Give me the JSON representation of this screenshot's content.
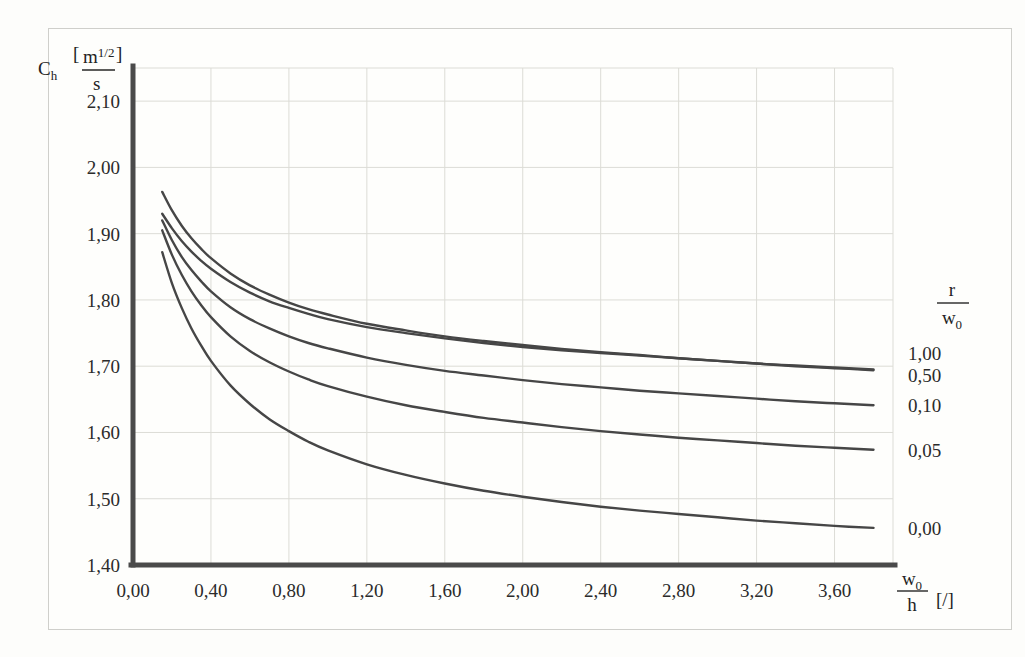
{
  "figure": {
    "yaxis_symbol": "C",
    "yaxis_subscript": "h",
    "yaxis_unit_numerator": "m",
    "yaxis_unit_numerator_exp": "1/2",
    "yaxis_unit_denominator": "s",
    "xaxis_numerator": "w",
    "xaxis_numerator_subscript": "0",
    "xaxis_denominator": "h",
    "xaxis_unit": "[/]",
    "legend_numerator": "r",
    "legend_denominator": "w",
    "legend_denominator_subscript": "0"
  },
  "chart_data": {
    "type": "line",
    "title": "",
    "xlabel": "w0/h [/]",
    "ylabel": "Ch [m^(1/2)/s]",
    "xlim": [
      0.0,
      3.9
    ],
    "ylim": [
      1.4,
      2.15
    ],
    "grid": true,
    "legend_position": "right",
    "legend_title": "r/w0",
    "x_tick_labels": [
      "0,00",
      "0,40",
      "0,80",
      "1,20",
      "1,60",
      "2,00",
      "2,40",
      "2,80",
      "3,20",
      "3,60"
    ],
    "x_tick_values": [
      0.0,
      0.4,
      0.8,
      1.2,
      1.6,
      2.0,
      2.4,
      2.8,
      3.2,
      3.6
    ],
    "y_tick_labels": [
      "1,40",
      "1,50",
      "1,60",
      "1,70",
      "1,80",
      "1,90",
      "2,00",
      "2,10"
    ],
    "y_tick_values": [
      1.4,
      1.5,
      1.6,
      1.7,
      1.8,
      1.9,
      2.0,
      2.1
    ],
    "series": [
      {
        "name": "1,00",
        "label": "1,00",
        "x": [
          0.15,
          0.2,
          0.25,
          0.3,
          0.35,
          0.4,
          0.5,
          0.6,
          0.7,
          0.8,
          0.9,
          1.0,
          1.2,
          1.4,
          1.6,
          1.8,
          2.0,
          2.2,
          2.4,
          2.6,
          2.8,
          3.0,
          3.2,
          3.4,
          3.6,
          3.8
        ],
        "y": [
          1.963,
          1.935,
          1.912,
          1.893,
          1.877,
          1.863,
          1.84,
          1.822,
          1.808,
          1.796,
          1.786,
          1.778,
          1.764,
          1.754,
          1.745,
          1.738,
          1.732,
          1.726,
          1.721,
          1.717,
          1.712,
          1.708,
          1.704,
          1.7,
          1.697,
          1.694
        ]
      },
      {
        "name": "0,50",
        "label": "0,50",
        "x": [
          0.15,
          0.2,
          0.25,
          0.3,
          0.35,
          0.4,
          0.5,
          0.6,
          0.7,
          0.8,
          0.9,
          1.0,
          1.2,
          1.4,
          1.6,
          1.8,
          2.0,
          2.2,
          2.4,
          2.6,
          2.8,
          3.0,
          3.2,
          3.4,
          3.6,
          3.8
        ],
        "y": [
          1.93,
          1.908,
          1.889,
          1.873,
          1.859,
          1.847,
          1.827,
          1.811,
          1.798,
          1.788,
          1.779,
          1.771,
          1.759,
          1.75,
          1.742,
          1.735,
          1.729,
          1.724,
          1.72,
          1.716,
          1.712,
          1.708,
          1.704,
          1.701,
          1.698,
          1.695
        ]
      },
      {
        "name": "0,10",
        "label": "0,10",
        "x": [
          0.15,
          0.2,
          0.25,
          0.3,
          0.35,
          0.4,
          0.5,
          0.6,
          0.7,
          0.8,
          0.9,
          1.0,
          1.2,
          1.4,
          1.6,
          1.8,
          2.0,
          2.2,
          2.4,
          2.6,
          2.8,
          3.0,
          3.2,
          3.4,
          3.6,
          3.8
        ],
        "y": [
          1.92,
          1.89,
          1.865,
          1.845,
          1.828,
          1.813,
          1.789,
          1.771,
          1.757,
          1.745,
          1.735,
          1.727,
          1.713,
          1.702,
          1.693,
          1.686,
          1.679,
          1.673,
          1.668,
          1.663,
          1.659,
          1.655,
          1.651,
          1.647,
          1.644,
          1.641
        ]
      },
      {
        "name": "0,05",
        "label": "0,05",
        "x": [
          0.15,
          0.2,
          0.25,
          0.3,
          0.35,
          0.4,
          0.5,
          0.6,
          0.7,
          0.8,
          0.9,
          1.0,
          1.2,
          1.4,
          1.6,
          1.8,
          2.0,
          2.2,
          2.4,
          2.6,
          2.8,
          3.0,
          3.2,
          3.4,
          3.6,
          3.8
        ],
        "y": [
          1.905,
          1.868,
          1.838,
          1.813,
          1.792,
          1.774,
          1.745,
          1.723,
          1.706,
          1.692,
          1.68,
          1.67,
          1.654,
          1.641,
          1.631,
          1.622,
          1.615,
          1.608,
          1.602,
          1.597,
          1.592,
          1.588,
          1.584,
          1.58,
          1.577,
          1.574
        ]
      },
      {
        "name": "0,00",
        "label": "0,00",
        "x": [
          0.15,
          0.2,
          0.25,
          0.3,
          0.35,
          0.4,
          0.5,
          0.6,
          0.7,
          0.8,
          0.9,
          1.0,
          1.2,
          1.4,
          1.6,
          1.8,
          2.0,
          2.2,
          2.4,
          2.6,
          2.8,
          3.0,
          3.2,
          3.4,
          3.6,
          3.8
        ],
        "y": [
          1.872,
          1.825,
          1.788,
          1.757,
          1.731,
          1.708,
          1.671,
          1.643,
          1.62,
          1.602,
          1.586,
          1.573,
          1.552,
          1.536,
          1.523,
          1.512,
          1.503,
          1.495,
          1.488,
          1.482,
          1.477,
          1.472,
          1.467,
          1.463,
          1.459,
          1.456
        ]
      }
    ],
    "legend_entries": [
      "1,00",
      "0,50",
      "0,10",
      "0,05",
      "0,00"
    ],
    "colors": {
      "curve": "#464646",
      "axis": "#4a4a4a",
      "grid": "#dcdcd6",
      "text": "#2b2b2b",
      "background": "#fefefc"
    }
  }
}
